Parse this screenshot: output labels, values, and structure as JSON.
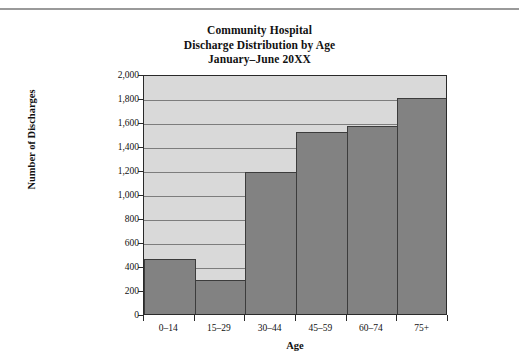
{
  "chart_data": {
    "type": "bar",
    "title": "Community Hospital Discharge Distribution by Age January–June 20XX",
    "title_lines": [
      "Community Hospital",
      "Discharge Distribution by Age",
      "January–June 20XX"
    ],
    "xlabel": "Age",
    "ylabel": "Number of Discharges",
    "categories": [
      "0–14",
      "15–29",
      "30–44",
      "45–59",
      "60–74",
      "75+"
    ],
    "values": [
      460,
      280,
      1180,
      1520,
      1565,
      1800
    ],
    "ylim": [
      0,
      2000
    ],
    "ytick_values": [
      0,
      200,
      400,
      600,
      800,
      1000,
      1200,
      1400,
      1600,
      1800,
      2000
    ],
    "ytick_labels": [
      "0",
      "200",
      "400",
      "600",
      "800",
      "1,000",
      "1,200",
      "1,400",
      "1,600",
      "1,800",
      "2,000"
    ],
    "grid": true,
    "legend": false,
    "bar_gap": 0,
    "colors": {
      "bar_fill": "#828282",
      "bar_edge": "#3c3c3c",
      "plot_background": "#d9d9d9",
      "gridline": "#7d7d7d",
      "axis": "#2a2a2a",
      "text": "#111111",
      "page_background": "#ffffff",
      "rule": "#9a9a9a"
    }
  }
}
